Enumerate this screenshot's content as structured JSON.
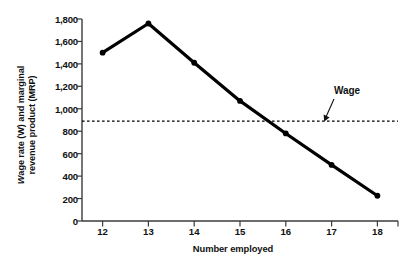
{
  "chart_data": {
    "type": "line",
    "title": "",
    "xlabel": "Number employed",
    "ylabel_line1": "Wage rate (W) and marginal",
    "ylabel_line2": "revenue product (MRP)",
    "ylabel_italic_token": "W",
    "x": [
      12,
      13,
      14,
      15,
      16,
      17,
      18
    ],
    "xticklabels": [
      "12",
      "13",
      "14",
      "15",
      "16",
      "17",
      "18"
    ],
    "yticks": [
      0,
      200,
      400,
      600,
      800,
      1000,
      1200,
      1400,
      1600,
      1800
    ],
    "yticklabels": [
      "0",
      "200",
      "400",
      "600",
      "800",
      "1,000",
      "1,200",
      "1,400",
      "1,600",
      "1,800"
    ],
    "xlim": [
      11.55,
      18.45
    ],
    "ylim": [
      0,
      1800
    ],
    "grid": false,
    "legend": "none",
    "series": [
      {
        "name": "MRP",
        "type": "line",
        "marker": "circle",
        "color": "#000000",
        "linewidth": 3.2,
        "values": [
          1500,
          1760,
          1410,
          1070,
          780,
          500,
          225
        ]
      }
    ],
    "reference_lines": [
      {
        "name": "Wage",
        "orientation": "horizontal",
        "value": 890,
        "style": "dashed",
        "color": "#000000"
      }
    ],
    "annotations": [
      {
        "name": "wage-annotation",
        "text": "Wage",
        "points_to_value": 890,
        "arrow": true
      }
    ]
  },
  "colors": {
    "line": "#000000",
    "axis": "#3b3b3b",
    "text": "#111111",
    "background": "#ffffff"
  }
}
